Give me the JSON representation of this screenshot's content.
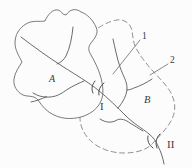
{
  "figure": {
    "type": "watershed-map-diagram",
    "region_a": {
      "label": "A",
      "style": "hatched-solid-outline"
    },
    "region_b": {
      "label": "B",
      "style": "dashed-outline"
    },
    "callouts": [
      {
        "label": "1",
        "points_to": "river-network"
      },
      {
        "label": "2",
        "points_to": "dashed-boundary"
      }
    ],
    "sections": [
      {
        "label": "I",
        "position": "mid-stream"
      },
      {
        "label": "II",
        "position": "outlet"
      }
    ]
  },
  "colors": {
    "background": "#fcfcfc",
    "solid_line": "#5a5a5a",
    "outline": "#6b6b6b",
    "dashed_boundary": "#8f8f8f",
    "hatch": "#8c8c8c",
    "text": "#3a3a3a"
  }
}
